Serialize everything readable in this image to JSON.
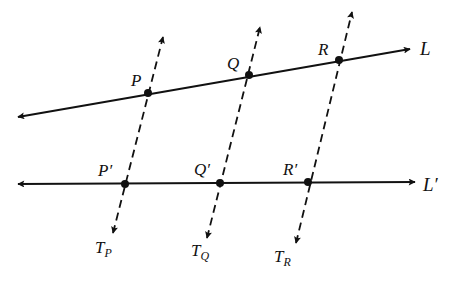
{
  "diagram": {
    "type": "geometry-lines",
    "colors": {
      "ink": "#111111",
      "background": "#ffffff"
    },
    "lines": [
      {
        "id": "L",
        "label": "L",
        "start": [
          18,
          117
        ],
        "end": [
          410,
          49
        ],
        "style": "solid",
        "arrows": "both"
      },
      {
        "id": "Lp",
        "label": "L′",
        "start": [
          18,
          184
        ],
        "end": [
          415,
          182
        ],
        "style": "solid",
        "arrows": "both"
      }
    ],
    "transversals": [
      {
        "id": "TP",
        "label_main": "T",
        "label_sub": "P",
        "top": [
          163,
          37
        ],
        "bottom": [
          113,
          233
        ]
      },
      {
        "id": "TQ",
        "label_main": "T",
        "label_sub": "Q",
        "top": [
          260,
          27
        ],
        "bottom": [
          207,
          238
        ]
      },
      {
        "id": "TR",
        "label_main": "T",
        "label_sub": "R",
        "top": [
          352,
          12
        ],
        "bottom": [
          296,
          243
        ]
      }
    ],
    "points": [
      {
        "id": "P",
        "label": "P",
        "pos": [
          148,
          93
        ],
        "label_pos": [
          131,
          86
        ]
      },
      {
        "id": "Q",
        "label": "Q",
        "pos": [
          249,
          75
        ],
        "label_pos": [
          227,
          69
        ]
      },
      {
        "id": "R",
        "label": "R",
        "pos": [
          339,
          60
        ],
        "label_pos": [
          318,
          55
        ]
      },
      {
        "id": "Pp",
        "label": "P′",
        "pos": [
          125,
          184
        ],
        "label_pos": [
          98,
          176
        ]
      },
      {
        "id": "Qp",
        "label": "Q′",
        "pos": [
          220,
          183
        ],
        "label_pos": [
          194,
          175
        ]
      },
      {
        "id": "Rp",
        "label": "R′",
        "pos": [
          308,
          182
        ],
        "label_pos": [
          283,
          175
        ]
      }
    ],
    "line_labels": [
      {
        "text": "L",
        "pos": [
          420,
          55
        ]
      },
      {
        "text": "L′",
        "pos": [
          423,
          191
        ]
      }
    ],
    "transversal_labels": [
      {
        "main": "T",
        "sub": "P",
        "pos": [
          95,
          253
        ]
      },
      {
        "main": "T",
        "sub": "Q",
        "pos": [
          191,
          256
        ]
      },
      {
        "main": "T",
        "sub": "R",
        "pos": [
          274,
          262
        ]
      }
    ]
  }
}
